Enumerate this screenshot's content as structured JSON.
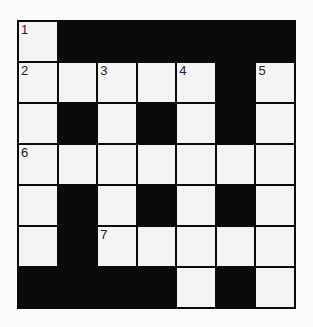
{
  "puzzle": {
    "rows": 7,
    "cols": 7,
    "grid": [
      [
        "W",
        "B",
        "B",
        "B",
        "B",
        "B",
        "B"
      ],
      [
        "W",
        "W",
        "W",
        "W",
        "W",
        "B",
        "W"
      ],
      [
        "W",
        "B",
        "W",
        "B",
        "W",
        "B",
        "W"
      ],
      [
        "W",
        "W",
        "W",
        "W",
        "W",
        "W",
        "W"
      ],
      [
        "W",
        "B",
        "W",
        "B",
        "W",
        "B",
        "W"
      ],
      [
        "W",
        "B",
        "W",
        "W",
        "W",
        "W",
        "W"
      ],
      [
        "B",
        "B",
        "B",
        "B",
        "W",
        "B",
        "W"
      ]
    ],
    "numbers": [
      {
        "row": 0,
        "col": 0,
        "label": "1"
      },
      {
        "row": 1,
        "col": 0,
        "label": "2"
      },
      {
        "row": 1,
        "col": 2,
        "label": "3"
      },
      {
        "row": 1,
        "col": 4,
        "label": "4"
      },
      {
        "row": 1,
        "col": 6,
        "label": "5"
      },
      {
        "row": 3,
        "col": 0,
        "label": "6"
      },
      {
        "row": 5,
        "col": 2,
        "label": "7"
      }
    ],
    "colors": {
      "block": "#0a0a0a",
      "cell": "#f4f4f4"
    }
  }
}
